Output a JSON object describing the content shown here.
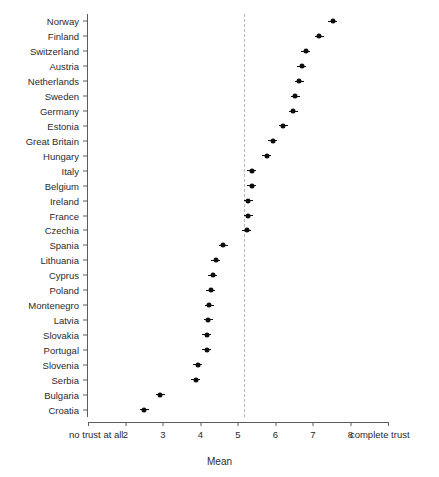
{
  "chart_data": {
    "type": "scatter",
    "orientation": "horizontal",
    "title": "",
    "subtitle": "",
    "xlabel": "Mean",
    "ylabel": "",
    "xlim": [
      1.0,
      9.0
    ],
    "xticks": [
      2,
      3,
      4,
      5,
      6,
      7,
      8
    ],
    "xticklabels": [
      "2",
      "3",
      "4",
      "5",
      "6",
      "7",
      "8"
    ],
    "x_axis_end_labels": {
      "left": "no trust at all",
      "right": "complete trust"
    },
    "grid": false,
    "legend": null,
    "reference_line": {
      "orientation": "vertical",
      "value": 5.17,
      "style": "dashed",
      "color": "#b9b9b9"
    },
    "marker": {
      "shape": "point-with-interval",
      "color": "#0d0d0d"
    },
    "categories": [
      "Norway",
      "Finland",
      "Switzerland",
      "Austria",
      "Netherlands",
      "Sweden",
      "Germany",
      "Estonia",
      "Great Britain",
      "Hungary",
      "Italy",
      "Belgium",
      "Ireland",
      "France",
      "Czechia",
      "Spania",
      "Lithuania",
      "Cyprus",
      "Poland",
      "Montenegro",
      "Latvia",
      "Slovakia",
      "Portugal",
      "Slovenia",
      "Serbia",
      "Bulgaria",
      "Croatia"
    ],
    "values": [
      7.53,
      7.17,
      6.8,
      6.7,
      6.63,
      6.53,
      6.47,
      6.2,
      5.93,
      5.77,
      5.37,
      5.37,
      5.27,
      5.27,
      5.23,
      4.6,
      4.4,
      4.33,
      4.27,
      4.23,
      4.2,
      4.17,
      4.17,
      3.93,
      3.87,
      2.93,
      2.5
    ],
    "points": [
      {
        "label": "Norway",
        "value": 7.53
      },
      {
        "label": "Finland",
        "value": 7.17
      },
      {
        "label": "Switzerland",
        "value": 6.8
      },
      {
        "label": "Austria",
        "value": 6.7
      },
      {
        "label": "Netherlands",
        "value": 6.63
      },
      {
        "label": "Sweden",
        "value": 6.53
      },
      {
        "label": "Germany",
        "value": 6.47
      },
      {
        "label": "Estonia",
        "value": 6.2
      },
      {
        "label": "Great Britain",
        "value": 5.93
      },
      {
        "label": "Hungary",
        "value": 5.77
      },
      {
        "label": "Italy",
        "value": 5.37
      },
      {
        "label": "Belgium",
        "value": 5.37
      },
      {
        "label": "Ireland",
        "value": 5.27
      },
      {
        "label": "France",
        "value": 5.27
      },
      {
        "label": "Czechia",
        "value": 5.23
      },
      {
        "label": "Spania",
        "value": 4.6
      },
      {
        "label": "Lithuania",
        "value": 4.4
      },
      {
        "label": "Cyprus",
        "value": 4.33
      },
      {
        "label": "Poland",
        "value": 4.27
      },
      {
        "label": "Montenegro",
        "value": 4.23
      },
      {
        "label": "Latvia",
        "value": 4.2
      },
      {
        "label": "Slovakia",
        "value": 4.17
      },
      {
        "label": "Portugal",
        "value": 4.17
      },
      {
        "label": "Slovenia",
        "value": 3.93
      },
      {
        "label": "Serbia",
        "value": 3.87
      },
      {
        "label": "Bulgaria",
        "value": 2.93
      },
      {
        "label": "Croatia",
        "value": 2.5
      }
    ]
  }
}
